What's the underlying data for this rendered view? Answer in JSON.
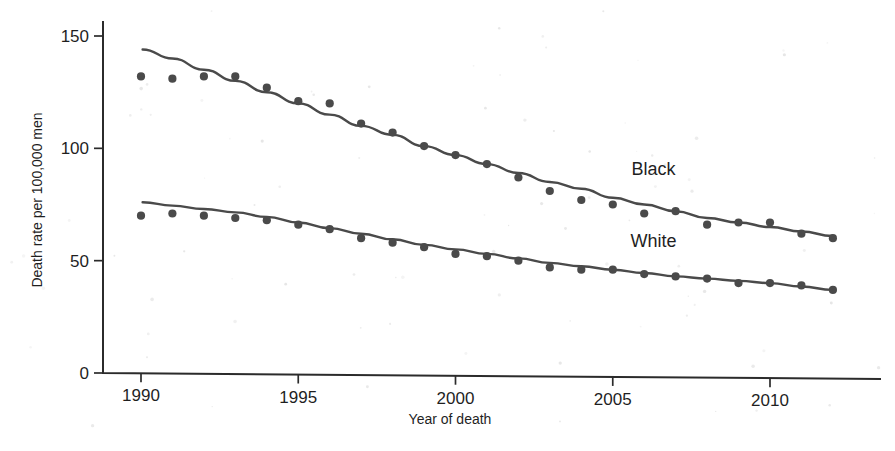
{
  "chart_data": {
    "type": "scatter",
    "title": "",
    "subtitle": "",
    "xlabel": "Year of death",
    "ylabel": "Death rate per 100,000 men",
    "xlim": [
      1989.2,
      2012.8
    ],
    "ylim": [
      0,
      158
    ],
    "grid": false,
    "legend_position": "inline-right",
    "xticks": [
      1990,
      1995,
      2000,
      2005,
      2010
    ],
    "xtick_labels": [
      "1990",
      "1995",
      "2000",
      "2005",
      "2010"
    ],
    "yticks": [
      0,
      50,
      100,
      150
    ],
    "ytick_labels": [
      "0",
      "50",
      "100",
      "150"
    ],
    "x": [
      1990,
      1991,
      1992,
      1993,
      1994,
      1995,
      1996,
      1997,
      1998,
      1999,
      2000,
      2001,
      2002,
      2003,
      2004,
      2005,
      2006,
      2007,
      2008,
      2009,
      2010,
      2011,
      2012
    ],
    "series": [
      {
        "name": "Black",
        "label": "Black",
        "color": "#4a4a4a",
        "marker": "circle",
        "values": [
          132,
          131,
          132,
          132,
          127,
          121,
          120,
          111,
          107,
          101,
          97,
          93,
          87,
          81,
          77,
          75,
          71,
          72,
          66,
          67,
          67,
          62,
          60
        ],
        "fit_curve": {
          "kind": "smoothed-trend",
          "points": [
            [
              1990.05,
              144
            ],
            [
              1991,
              140
            ],
            [
              1992,
              135
            ],
            [
              1993,
              130
            ],
            [
              1994,
              125
            ],
            [
              1995,
              120
            ],
            [
              1996,
              115
            ],
            [
              1997,
              110
            ],
            [
              1998,
              106
            ],
            [
              1999,
              101
            ],
            [
              2000,
              97
            ],
            [
              2001,
              93
            ],
            [
              2002,
              89
            ],
            [
              2003,
              85
            ],
            [
              2004,
              82
            ],
            [
              2005,
              78
            ],
            [
              2006,
              75
            ],
            [
              2007,
              72
            ],
            [
              2008,
              69
            ],
            [
              2009,
              67
            ],
            [
              2010,
              65
            ],
            [
              2011,
              63
            ],
            [
              2012,
              61
            ]
          ]
        }
      },
      {
        "name": "White",
        "label": "White",
        "color": "#4a4a4a",
        "marker": "circle",
        "values": [
          70,
          71,
          70,
          69,
          68,
          66,
          64,
          60,
          58,
          56,
          53,
          52,
          50,
          47,
          46,
          46,
          44,
          43,
          42,
          40,
          40,
          39,
          37
        ],
        "fit_curve": {
          "kind": "smoothed-trend",
          "points": [
            [
              1990.05,
              76
            ],
            [
              1991,
              74.5
            ],
            [
              1992,
              73
            ],
            [
              1993,
              71.5
            ],
            [
              1994,
              69.5
            ],
            [
              1995,
              67
            ],
            [
              1996,
              64.5
            ],
            [
              1997,
              62
            ],
            [
              1998,
              59.5
            ],
            [
              1999,
              57
            ],
            [
              2000,
              55
            ],
            [
              2001,
              53
            ],
            [
              2002,
              51
            ],
            [
              2003,
              49
            ],
            [
              2004,
              47.5
            ],
            [
              2005,
              46
            ],
            [
              2006,
              44.5
            ],
            [
              2007,
              43
            ],
            [
              2008,
              42
            ],
            [
              2009,
              41
            ],
            [
              2010,
              40
            ],
            [
              2011,
              38.5
            ],
            [
              2012,
              37
            ]
          ]
        }
      }
    ],
    "annotations": [
      {
        "text": "Black",
        "x": 2006.3,
        "y": 88,
        "name": "black-series-label"
      },
      {
        "text": "White",
        "x": 2006.3,
        "y": 56,
        "name": "white-series-label"
      }
    ]
  }
}
